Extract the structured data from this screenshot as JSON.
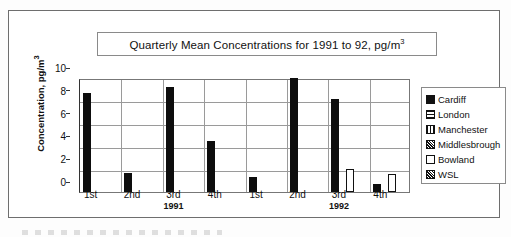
{
  "chart_data": {
    "type": "bar",
    "title_parts": {
      "main": "Quarterly Mean Concentrations for 1991 to 92, pg/m",
      "sup": "3"
    },
    "xlabel": "",
    "ylabel": "Concentration, pg/m",
    "ylabel_sup": "3",
    "ylim": [
      0,
      10
    ],
    "yticks": [
      0,
      2,
      4,
      6,
      8,
      10
    ],
    "ytick_labels": [
      "0",
      "2",
      "4",
      "6",
      "8",
      "10"
    ],
    "grid": true,
    "legend_position": "right",
    "categories": [
      "1st",
      "2nd",
      "3rd",
      "4th",
      "1st",
      "2nd",
      "3rd",
      "4th"
    ],
    "group_labels": [
      "1991",
      "1992"
    ],
    "series": [
      {
        "name": "Cardiff",
        "pattern": "solid",
        "color": "#111111",
        "values": [
          8.7,
          1.7,
          9.2,
          4.5,
          1.35,
          10.0,
          8.2,
          0.7
        ]
      },
      {
        "name": "London",
        "pattern": "horizontal-lines",
        "color": "#111111",
        "values": [
          null,
          null,
          null,
          null,
          null,
          null,
          null,
          null
        ]
      },
      {
        "name": "Manchester",
        "pattern": "vertical-lines",
        "color": "#111111",
        "values": [
          null,
          null,
          null,
          null,
          null,
          null,
          null,
          null
        ]
      },
      {
        "name": "Middlesbrough",
        "pattern": "crosshatch",
        "color": "#111111",
        "values": [
          null,
          null,
          null,
          null,
          null,
          null,
          null,
          null
        ]
      },
      {
        "name": "Bowland",
        "pattern": "empty",
        "color": "#ffffff",
        "values": [
          null,
          null,
          null,
          null,
          null,
          null,
          2.05,
          1.6
        ]
      },
      {
        "name": "WSL",
        "pattern": "crosshatch",
        "color": "#111111",
        "values": [
          null,
          null,
          null,
          null,
          null,
          null,
          null,
          null
        ]
      }
    ]
  },
  "legend": {
    "items": [
      {
        "label": "Cardiff",
        "swatch": "sw-solid"
      },
      {
        "label": "London",
        "swatch": "sw-hlines"
      },
      {
        "label": "Manchester",
        "swatch": "sw-vlines"
      },
      {
        "label": "Middlesbrough",
        "swatch": "sw-cross"
      },
      {
        "label": "Bowland",
        "swatch": "sw-empty"
      },
      {
        "label": "WSL",
        "swatch": "sw-cross"
      }
    ]
  }
}
